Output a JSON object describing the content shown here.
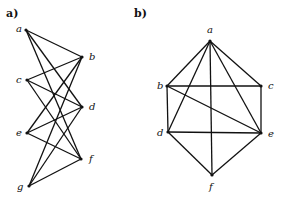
{
  "panels": [
    {
      "label": "a)",
      "label_pos": [
        6,
        17
      ],
      "vertices": [
        {
          "id": "a",
          "x": 26,
          "y": 30,
          "lx": 16,
          "ly": 32
        },
        {
          "id": "b",
          "x": 82,
          "y": 57,
          "lx": 89,
          "ly": 60
        },
        {
          "id": "c",
          "x": 27,
          "y": 80,
          "lx": 16,
          "ly": 83
        },
        {
          "id": "d",
          "x": 82,
          "y": 107,
          "lx": 89,
          "ly": 110
        },
        {
          "id": "e",
          "x": 27,
          "y": 133,
          "lx": 16,
          "ly": 136
        },
        {
          "id": "f",
          "x": 81,
          "y": 159,
          "lx": 89,
          "ly": 162
        },
        {
          "id": "g",
          "x": 29,
          "y": 186,
          "lx": 17,
          "ly": 190
        }
      ],
      "edges": [
        [
          "a",
          "b"
        ],
        [
          "a",
          "d"
        ],
        [
          "a",
          "f"
        ],
        [
          "c",
          "b"
        ],
        [
          "c",
          "d"
        ],
        [
          "c",
          "f"
        ],
        [
          "e",
          "b"
        ],
        [
          "e",
          "d"
        ],
        [
          "e",
          "f"
        ],
        [
          "g",
          "b"
        ],
        [
          "g",
          "d"
        ],
        [
          "g",
          "f"
        ]
      ]
    },
    {
      "label": "b)",
      "label_pos": [
        134,
        17
      ],
      "vertices": [
        {
          "id": "a",
          "x": 210,
          "y": 41,
          "lx": 207,
          "ly": 33
        },
        {
          "id": "b",
          "x": 167,
          "y": 86,
          "lx": 157,
          "ly": 89
        },
        {
          "id": "c",
          "x": 261,
          "y": 86,
          "lx": 268,
          "ly": 89
        },
        {
          "id": "d",
          "x": 168,
          "y": 132,
          "lx": 157,
          "ly": 136
        },
        {
          "id": "e",
          "x": 261,
          "y": 133,
          "lx": 268,
          "ly": 137
        },
        {
          "id": "f",
          "x": 212,
          "y": 175,
          "lx": 209,
          "ly": 190
        }
      ],
      "edges": [
        [
          "a",
          "b"
        ],
        [
          "a",
          "c"
        ],
        [
          "a",
          "d"
        ],
        [
          "a",
          "e"
        ],
        [
          "a",
          "f"
        ],
        [
          "b",
          "c"
        ],
        [
          "b",
          "d"
        ],
        [
          "b",
          "e"
        ],
        [
          "c",
          "e"
        ],
        [
          "d",
          "e"
        ],
        [
          "d",
          "f"
        ],
        [
          "e",
          "f"
        ]
      ]
    }
  ]
}
